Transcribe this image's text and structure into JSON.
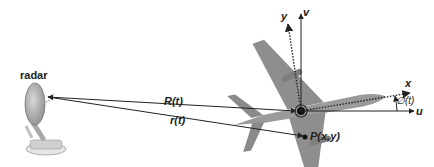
{
  "diagram": {
    "radar_label": "radar",
    "labels": {
      "range_center": "R(t)",
      "range_point": "r(t)",
      "point": "P(x,y)",
      "axis_x": "x",
      "axis_y": "y",
      "axis_u": "u",
      "axis_v": "v",
      "angle": "∅(t)"
    },
    "colors": {
      "line": "#222222",
      "aircraft": "#9a9a9a",
      "aircraft_dark": "#7a7a7a",
      "radar": "#b5b5b5"
    }
  }
}
